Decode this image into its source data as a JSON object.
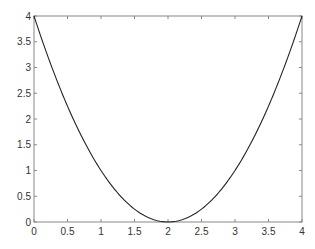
{
  "chart_data": {
    "type": "line",
    "title": "",
    "xlabel": "",
    "ylabel": "",
    "xlim": [
      0,
      4
    ],
    "ylim": [
      0,
      4
    ],
    "grid": false,
    "legend": null,
    "x_ticks": [
      "0",
      "0.5",
      "1",
      "1.5",
      "2",
      "2.5",
      "3",
      "3.5",
      "4"
    ],
    "y_ticks": [
      "0",
      "0.5",
      "1",
      "1.5",
      "2",
      "2.5",
      "3",
      "3.5",
      "4"
    ],
    "series": [
      {
        "name": "y = (x-2)^2",
        "color": "#222222",
        "x": [
          0,
          0.25,
          0.5,
          0.75,
          1,
          1.25,
          1.5,
          1.75,
          2,
          2.25,
          2.5,
          2.75,
          3,
          3.25,
          3.5,
          3.75,
          4
        ],
        "y": [
          4,
          3.0625,
          2.25,
          1.5625,
          1,
          0.5625,
          0.25,
          0.0625,
          0,
          0.0625,
          0.25,
          0.5625,
          1,
          1.5625,
          2.25,
          3.0625,
          4
        ]
      }
    ]
  },
  "style": {
    "axis_color": "#888888",
    "line_color": "#222222"
  }
}
